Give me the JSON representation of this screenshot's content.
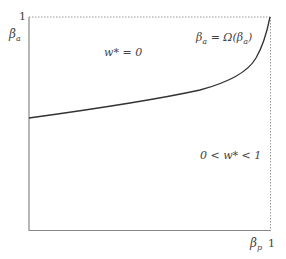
{
  "diagram": {
    "y_axis": {
      "label_symbol": "β",
      "label_sub": "a",
      "tick_top": "1"
    },
    "x_axis": {
      "label_symbol": "β",
      "label_sub": "p",
      "tick_right": "1"
    },
    "regions": {
      "upper": {
        "lhs": "w* = 0"
      },
      "lower": {
        "lhs": "0 < w* < 1"
      }
    },
    "curve_label": {
      "lhs_symbol": "β",
      "lhs_sub": "a",
      "eq": " = Ω(β",
      "rhs_sub": "a",
      "close": ")"
    },
    "colors": {
      "axis": "#888888",
      "curve": "#333333",
      "dotted": "#999999"
    }
  }
}
